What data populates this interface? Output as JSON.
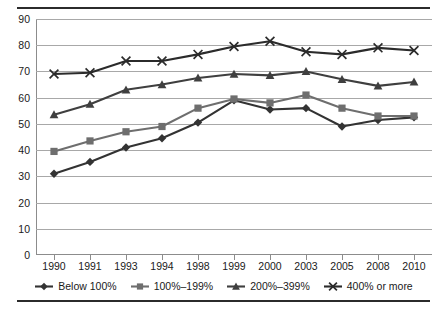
{
  "chart_data": {
    "type": "line",
    "title": "",
    "xlabel": "",
    "ylabel": "",
    "ylim": [
      0,
      90
    ],
    "ytick_step": 10,
    "yticks": [
      "90",
      "80",
      "70",
      "60",
      "50",
      "40",
      "30",
      "20",
      "10",
      "0"
    ],
    "grid": true,
    "legend_position": "bottom",
    "categories": [
      "1990",
      "1991",
      "1993",
      "1994",
      "1998",
      "1999",
      "2000",
      "2003",
      "2005",
      "2008",
      "2010"
    ],
    "series": [
      {
        "name": "Below 100%",
        "marker": "diamond",
        "color": "#333333",
        "values": [
          31,
          35.5,
          41,
          44.5,
          50.5,
          59,
          55.5,
          56,
          49,
          51.5,
          52.5
        ]
      },
      {
        "name": "100%–199%",
        "marker": "square",
        "color": "#6e6e6e",
        "values": [
          39.5,
          43.5,
          47,
          49,
          56,
          59.5,
          58,
          61,
          56,
          53,
          53
        ]
      },
      {
        "name": "200%–399%",
        "marker": "triangle",
        "color": "#3f3f3f",
        "values": [
          53.5,
          57.5,
          63,
          65,
          67.5,
          69,
          68.5,
          70,
          67,
          64.5,
          66
        ]
      },
      {
        "name": "400% or more",
        "marker": "cross",
        "color": "#2b2b2b",
        "values": [
          69,
          69.5,
          74,
          74,
          76.5,
          79.5,
          81.5,
          77.5,
          76.5,
          79,
          78
        ]
      }
    ]
  },
  "legend": {
    "items": [
      {
        "label": "Below 100%",
        "marker": "diamond"
      },
      {
        "label": "100%–199%",
        "marker": "square"
      },
      {
        "label": "200%–399%",
        "marker": "triangle"
      },
      {
        "label": "400% or more",
        "marker": "cross"
      }
    ]
  }
}
